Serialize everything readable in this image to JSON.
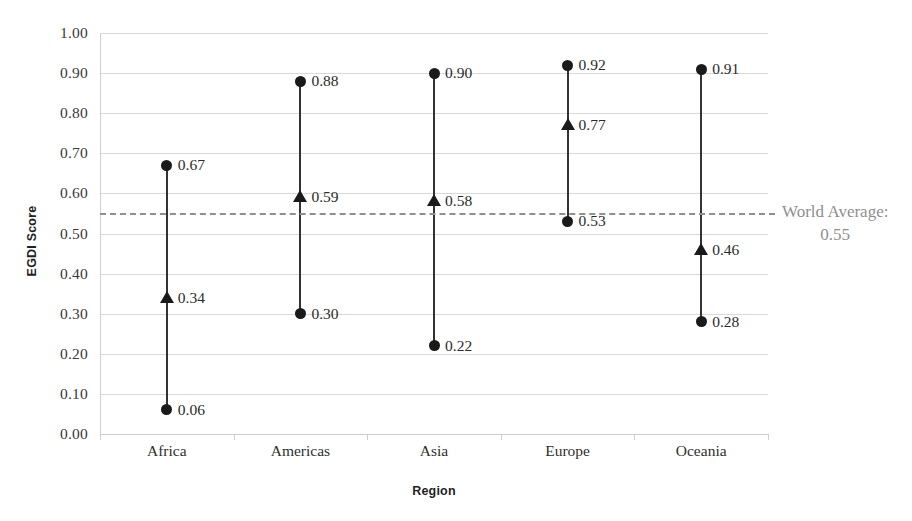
{
  "chart_data": {
    "type": "scatter",
    "title": "",
    "xlabel": "Region",
    "ylabel": "EGDI Score",
    "ylim": [
      0.0,
      1.0
    ],
    "ytick_step": 0.1,
    "grid": true,
    "legend": "none",
    "categories": [
      "Africa",
      "Americas",
      "Asia",
      "Europe",
      "Oceania"
    ],
    "ytick_labels": [
      "1.00",
      "0.90",
      "0.80",
      "0.70",
      "0.60",
      "0.50",
      "0.40",
      "0.30",
      "0.20",
      "0.10",
      "0.00"
    ],
    "ytick_values": [
      1.0,
      0.9,
      0.8,
      0.7,
      0.6,
      0.5,
      0.4,
      0.3,
      0.2,
      0.1,
      0.0
    ],
    "series": [
      {
        "name": "Maximum",
        "marker": "circle",
        "values": [
          0.67,
          0.88,
          0.9,
          0.92,
          0.91
        ]
      },
      {
        "name": "Average",
        "marker": "triangle",
        "values": [
          0.34,
          0.59,
          0.58,
          0.77,
          0.46
        ]
      },
      {
        "name": "Minimum",
        "marker": "circle",
        "values": [
          0.06,
          0.3,
          0.22,
          0.53,
          0.28
        ]
      }
    ],
    "point_labels": {
      "Africa": [
        "0.67",
        "0.34",
        "0.06"
      ],
      "Americas": [
        "0.88",
        "0.59",
        "0.30"
      ],
      "Asia": [
        "0.90",
        "0.58",
        "0.22"
      ],
      "Europe": [
        "0.92",
        "0.77",
        "0.53"
      ],
      "Oceania": [
        "0.91",
        "0.46",
        "0.28"
      ]
    },
    "reference_line": {
      "label": "World Average:",
      "value_label": "0.55",
      "value": 0.55,
      "style": "dashed",
      "color": "#8f8f8f"
    },
    "colors": {
      "marker": "#1a1a1a",
      "connector": "#333333",
      "gridline": "#d9d9d9",
      "reference": "#8f8f8f",
      "text": "#2b2b2b"
    }
  }
}
